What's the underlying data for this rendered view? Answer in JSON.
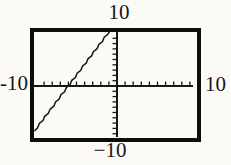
{
  "figure": {
    "bg_color": "#fbfaf7",
    "ink_color": "#161616",
    "box_color": "#0d0d0d"
  },
  "window_labels": {
    "top": "10",
    "bottom": "−10",
    "left": "-10",
    "right": "10"
  },
  "chart_data": {
    "type": "line",
    "title": "",
    "xlabel": "",
    "ylabel": "",
    "xlim": [
      -10,
      10
    ],
    "ylim": [
      -10,
      10
    ],
    "x_tick_step": 1,
    "y_tick_step": 1,
    "grid": false,
    "legend": "none",
    "axes_style": "cross-at-origin-with-ticks",
    "window_boundary_labels": {
      "xmin": "-10",
      "xmax": "10",
      "ymin": "−10",
      "ymax": "10"
    },
    "series": [
      {
        "name": "graphed-line",
        "style": "thin-jagged-pixel-plot",
        "points": [
          [
            -10.2,
            -8.5
          ],
          [
            -0.85,
            10.5
          ]
        ],
        "slope_estimate": 2,
        "x_intercept_estimate": -6,
        "y_intercept_estimate": 12
      }
    ]
  }
}
